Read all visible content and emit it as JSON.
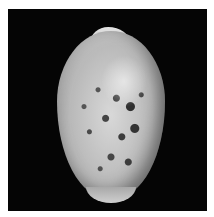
{
  "image": {
    "subject": "cowrie shell",
    "description": "Speckled cowrie shell photographed on a black background with a thin white border",
    "colors": {
      "border": "#ffffff",
      "background": "#050505",
      "shell_light": "#d8d8d8",
      "shell_spots": "#3a3a3a"
    }
  }
}
